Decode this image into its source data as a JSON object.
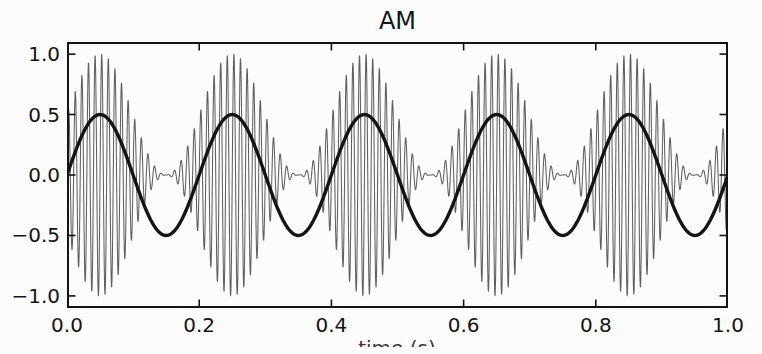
{
  "background": "#fcfcfc",
  "frame_color": "#141414",
  "tick_color": "#141414",
  "chart_data": {
    "type": "line",
    "title": "AM",
    "xlabel": "time (s)",
    "xlabel_visibility": "clipped-at-bottom-edge",
    "xlim": [
      0,
      1
    ],
    "ylim": [
      -1.1,
      1.1
    ],
    "grid": false,
    "legend": null,
    "xticks": [
      {
        "value": 0.0,
        "label": "0.0"
      },
      {
        "value": 0.2,
        "label": "0.2"
      },
      {
        "value": 0.4,
        "label": "0.4"
      },
      {
        "value": 0.6,
        "label": "0.6"
      },
      {
        "value": 0.8,
        "label": "0.8"
      },
      {
        "value": 1.0,
        "label": "1.0"
      }
    ],
    "yticks": [
      {
        "value": 1.0,
        "label": "1.0"
      },
      {
        "value": 0.5,
        "label": "0.5"
      },
      {
        "value": 0.0,
        "label": "0.0"
      },
      {
        "value": -0.5,
        "label": "−0.5"
      },
      {
        "value": -1.0,
        "label": "−1.0"
      }
    ],
    "series": [
      {
        "name": "am-modulated-carrier",
        "kind": "am_product",
        "description": "(0.5 + 0.5*sin(2*pi*5*t)) * sin(2*pi*100*t)",
        "carrier_freq_hz": 100,
        "modulation_freq_hz": 5,
        "offset": 0.5,
        "modulation_depth": 0.5,
        "peak_amplitude": 1.0,
        "color": "#5f5f5f",
        "linewidth": 1.05,
        "samples": 4800
      },
      {
        "name": "modulating-signal",
        "kind": "sine",
        "description": "0.5*sin(2*pi*5*t)",
        "freq_hz": 5,
        "amplitude": 0.5,
        "color": "#141414",
        "linewidth": 3.4,
        "samples": 700
      }
    ]
  },
  "layout_note": "single axes, ticks pointing inward on all four spines, no grid, no legend"
}
